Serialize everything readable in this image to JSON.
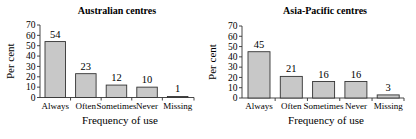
{
  "chart_data": [
    {
      "type": "bar",
      "title": "Australian centres",
      "xlabel": "Frequency of use",
      "ylabel": "Per cent",
      "categories": [
        "Always",
        "Often",
        "Sometimes",
        "Never",
        "Missing"
      ],
      "values": [
        54,
        23,
        12,
        10,
        1
      ],
      "value_labels": [
        "54",
        "23",
        "12",
        "10",
        "1"
      ],
      "ylim": [
        0,
        70
      ],
      "yticks": [
        0,
        10,
        20,
        30,
        40,
        50,
        60,
        70
      ],
      "grid": false,
      "legend": null
    },
    {
      "type": "bar",
      "title": "Asia-Pacific centres",
      "xlabel": "Frequency of use",
      "ylabel": "Per cent",
      "categories": [
        "Always",
        "Often",
        "Sometimes",
        "Never",
        "Missing"
      ],
      "values": [
        45,
        21,
        16,
        16,
        3
      ],
      "value_labels": [
        "45",
        "21",
        "16",
        "16",
        "3"
      ],
      "ylim": [
        0,
        70
      ],
      "yticks": [
        0,
        10,
        20,
        30,
        40,
        50,
        60,
        70
      ],
      "grid": false,
      "legend": null
    }
  ],
  "colors": {
    "bar_fill": "#c8c8c8",
    "bar_stroke": "#333333",
    "text": "#222222"
  }
}
